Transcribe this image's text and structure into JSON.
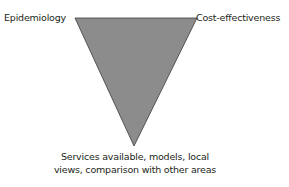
{
  "diagram": {
    "type": "inverted-triangle",
    "colors": {
      "triangle_fill": "#8c8c8c",
      "triangle_stroke": "#3a3a3a",
      "text": "#231f20",
      "background": "#ffffff"
    },
    "vertices": {
      "top_left": {
        "label": "Epidemiology"
      },
      "top_right": {
        "label": "Cost-effectiveness"
      },
      "bottom": {
        "label": "Services available, models, local views, comparison with other areas",
        "lines": [
          "Services available, models, local",
          "views, comparison with other areas"
        ]
      }
    }
  }
}
